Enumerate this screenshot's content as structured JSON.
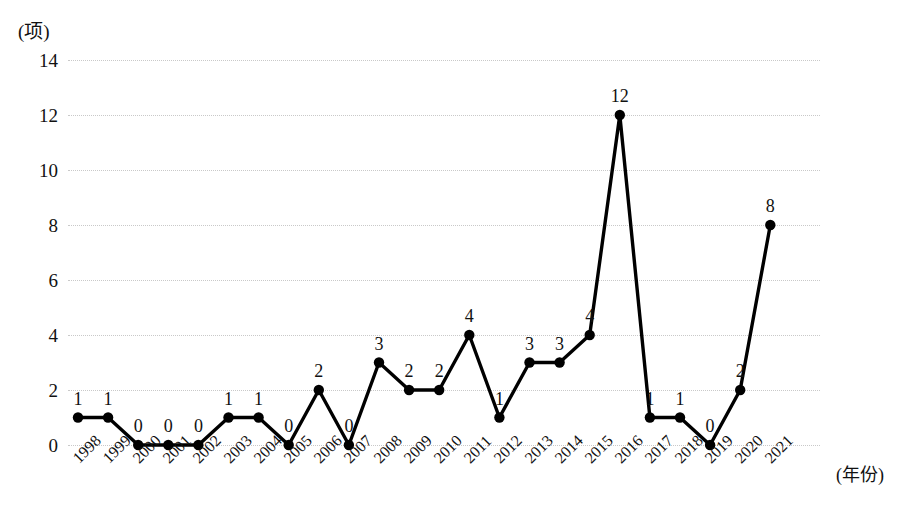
{
  "chart_data": {
    "type": "line",
    "title": "",
    "subtitle": "",
    "xlabel": "(年份)",
    "ylabel": "(项)",
    "categories": [
      "1998",
      "1999",
      "2000",
      "2001",
      "2002",
      "2003",
      "2004",
      "2005",
      "2006",
      "2007",
      "2008",
      "2009",
      "2010",
      "2011",
      "2012",
      "2013",
      "2014",
      "2015",
      "2016",
      "2017",
      "2018",
      "2019",
      "2020",
      "2021"
    ],
    "values": [
      1,
      1,
      0,
      0,
      0,
      1,
      1,
      0,
      2,
      0,
      3,
      2,
      2,
      4,
      1,
      3,
      3,
      4,
      12,
      1,
      1,
      0,
      2,
      8
    ],
    "point_labels": [
      "1",
      "1",
      "0",
      "0",
      "0",
      "1",
      "1",
      "0",
      "2",
      "0",
      "3",
      "2",
      "2",
      "4",
      "1",
      "3",
      "3",
      "4",
      "12",
      "1",
      "1",
      "0",
      "2",
      "8"
    ],
    "ylim": [
      0,
      14
    ],
    "ytick_labels": [
      "0",
      "2",
      "4",
      "6",
      "8",
      "10",
      "12",
      "14"
    ],
    "ytick_values": [
      0,
      2,
      4,
      6,
      8,
      10,
      12,
      14
    ],
    "grid": "horizontal-dotted",
    "legend": "none",
    "series_color": "#000000",
    "grid_color": "#c9c9c9",
    "marker": "filled-circle",
    "background": "#ffffff"
  }
}
